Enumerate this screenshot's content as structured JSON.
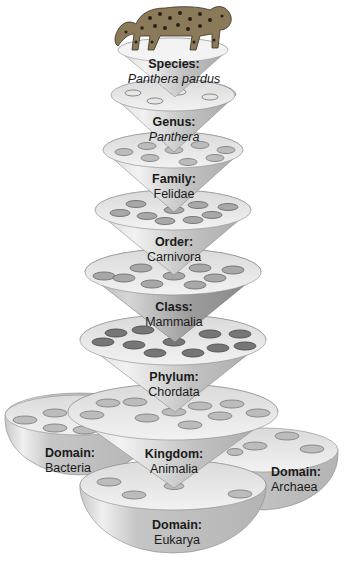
{
  "figure": {
    "subject_image": "leopard-illustration",
    "colors": {
      "background": "#ffffff",
      "cone_light": "#e4e4e4",
      "cone_mid": "#c4c4c4",
      "cone_dark": "#9a9a9a",
      "ellipse_fill": "#bdbdbd",
      "ellipse_dark": "#6e6e6e",
      "text": "#1a1a1a"
    }
  },
  "levels": [
    {
      "rank": "Species:",
      "name": "Panthera pardus",
      "italic": true
    },
    {
      "rank": "Genus:",
      "name": "Panthera",
      "italic": true
    },
    {
      "rank": "Family:",
      "name": "Felidae",
      "italic": false
    },
    {
      "rank": "Order:",
      "name": "Carnivora",
      "italic": false
    },
    {
      "rank": "Class:",
      "name": "Mammalia",
      "italic": false
    },
    {
      "rank": "Phylum:",
      "name": "Chordata",
      "italic": false
    },
    {
      "rank": "Kingdom:",
      "name": "Animalia",
      "italic": false
    }
  ],
  "domains": [
    {
      "rank": "Domain:",
      "name": "Bacteria"
    },
    {
      "rank": "Domain:",
      "name": "Archaea"
    },
    {
      "rank": "Domain:",
      "name": "Eukarya"
    }
  ]
}
